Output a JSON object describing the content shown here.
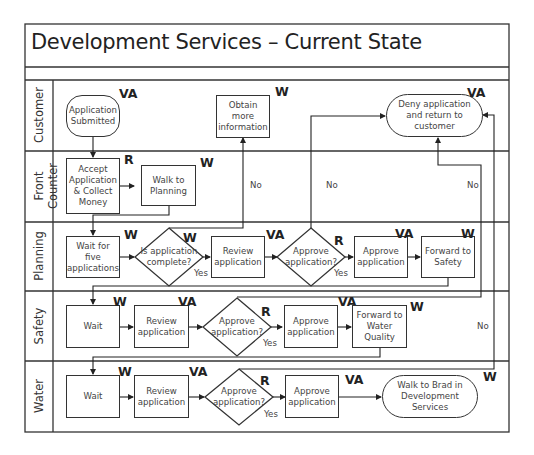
{
  "title": "Development Services – Current State",
  "lanes": [
    {
      "label": "Customer"
    },
    {
      "label": "Front Counter"
    },
    {
      "label": "Planning"
    },
    {
      "label": "Safety"
    },
    {
      "label": "Water"
    }
  ],
  "nodes": {
    "application_submitted": {
      "text": "Application Submitted",
      "tag": "VA"
    },
    "obtain_more_info": {
      "text": "Obtain more information",
      "tag": "W"
    },
    "deny_application": {
      "text": "Deny application and return to customer",
      "tag": "VA"
    },
    "accept_application": {
      "text": "Accept Application & Collect Money",
      "tag": "R"
    },
    "walk_to_planning": {
      "text": "Walk to Planning",
      "tag": "W"
    },
    "wait_five": {
      "text": "Wait for five applications",
      "tag": "W"
    },
    "is_complete": {
      "text": "Is application complete?",
      "tag": "W"
    },
    "planning_review": {
      "text": "Review application",
      "tag": "VA"
    },
    "planning_approve_q": {
      "text": "Approve application?",
      "tag": "R"
    },
    "planning_approve": {
      "text": "Approve application",
      "tag": "VA"
    },
    "forward_safety": {
      "text": "Forward to Safety",
      "tag": "W"
    },
    "safety_wait": {
      "text": "Wait",
      "tag": "W"
    },
    "safety_review": {
      "text": "Review application",
      "tag": "VA"
    },
    "safety_approve_q": {
      "text": "Approve application?",
      "tag": "R"
    },
    "safety_approve": {
      "text": "Approve application",
      "tag": "VA"
    },
    "forward_water": {
      "text": "Forward to Water Quality",
      "tag": "W"
    },
    "water_wait": {
      "text": "Wait",
      "tag": "W"
    },
    "water_review": {
      "text": "Review application",
      "tag": "VA"
    },
    "water_approve_q": {
      "text": "Approve application?",
      "tag": "R"
    },
    "water_approve": {
      "text": "Approve application",
      "tag": "VA"
    },
    "walk_to_brad": {
      "text": "Walk to Brad in Development Services",
      "tag": "W"
    }
  },
  "edge_labels": {
    "yes": "Yes",
    "no": "No"
  }
}
